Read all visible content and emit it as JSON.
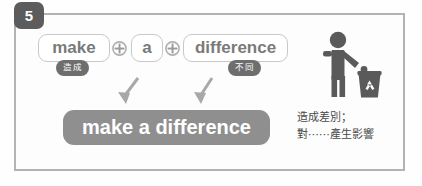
{
  "slide": {
    "number": "5",
    "badge_color": "#5c5c5c",
    "frame_border_color": "#b3b3b3"
  },
  "formula": {
    "words": [
      {
        "text": "make",
        "gloss": "造成"
      },
      {
        "text": "a",
        "gloss": ""
      },
      {
        "text": "difference",
        "gloss": "不同"
      }
    ],
    "operators": [
      {
        "name": "plus-circle-icon",
        "symbol": "+"
      },
      {
        "name": "plus-circle-icon",
        "symbol": "+"
      }
    ],
    "arrows": [
      {
        "name": "down-left-arrow-icon"
      },
      {
        "name": "down-left-arrow-icon"
      }
    ],
    "result": "make a difference",
    "result_color": "#8f8f8f",
    "gloss_color": "#6e6e6e",
    "pill_text_color": "#7a7a7a"
  },
  "illustration": {
    "name": "person-recycling-icon",
    "color": "#5a5a5a"
  },
  "translation": {
    "lines": [
      "造成差別；",
      "對⋯⋯產生影響"
    ],
    "text_color": "#4a4a4a"
  }
}
